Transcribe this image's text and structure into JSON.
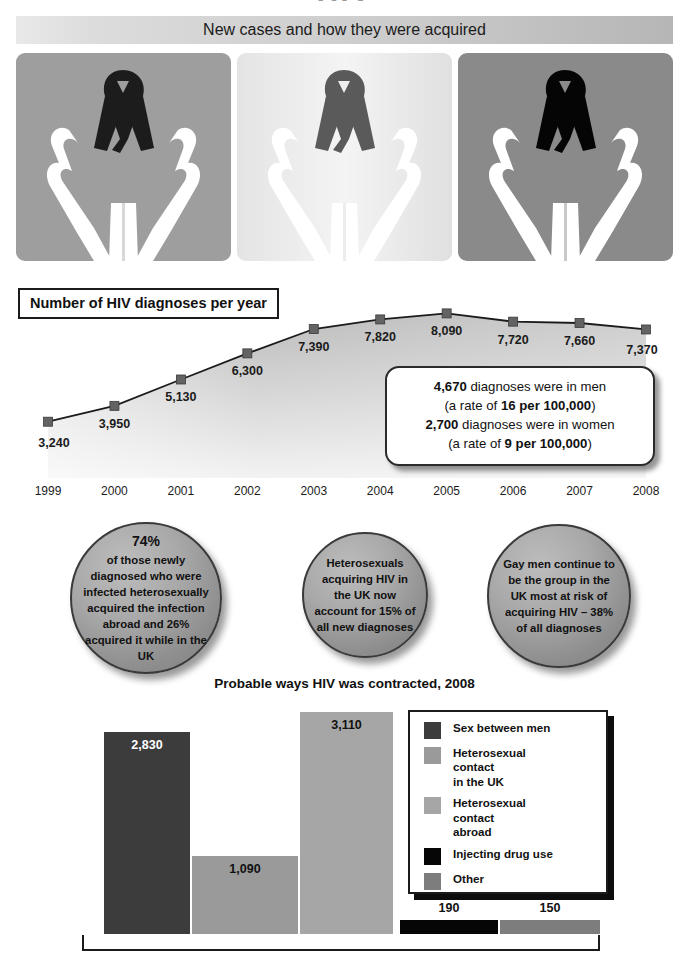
{
  "header": {
    "cut_title": "HIV",
    "subtitle": "New cases and how they were acquired",
    "panels": [
      {
        "name": "hands-ribbon-dark",
        "bg": "#9e9e9e",
        "ribbon": "#1c1c1c"
      },
      {
        "name": "hands-ribbon-mid",
        "bg": "#efefef",
        "ribbon": "#5a5a5a"
      },
      {
        "name": "hands-ribbon-black",
        "bg": "#8a8a8a",
        "ribbon": "#050505"
      }
    ]
  },
  "line_section": {
    "title": "Number of HIV diagnoses per year",
    "callout": {
      "line1_value": "4,670",
      "line1_text": " diagnoses were in men",
      "line2_pre": "(a rate of ",
      "line2_value": "16 per 100,000",
      "line2_post": ")",
      "line3_value": "2,700",
      "line3_text": " diagnoses were in women",
      "line4_pre": "(a rate of ",
      "line4_value": "9 per 100,000",
      "line4_post": ")"
    }
  },
  "bubbles": [
    {
      "name": "bubble-heterosexual-abroad",
      "line1": "74%",
      "body": "of those newly diagnosed who were infected heterosexually acquired the infection abroad and 26% acquired it while in the UK"
    },
    {
      "name": "bubble-heterosexual-uk",
      "line1": "",
      "body": "Heterosexuals acquiring HIV in the UK now account for 15% of all new diagnoses"
    },
    {
      "name": "bubble-gay-men",
      "line1": "",
      "body": "Gay men continue to be the group in the UK most at risk of acquiring HIV – 38% of all diagnoses"
    }
  ],
  "bar_section": {
    "title": "Probable ways HIV was contracted, 2008",
    "legend": [
      {
        "label": "Sex between men",
        "color": "#3c3c3c"
      },
      {
        "label": "Heterosexual\ncontact\nin the UK",
        "color": "#9a9a9a"
      },
      {
        "label": "Heterosexual\ncontact\nabroad",
        "color": "#a6a6a6"
      },
      {
        "label": "Injecting drug use",
        "color": "#060606"
      },
      {
        "label": "Other",
        "color": "#7d7d7d"
      }
    ]
  },
  "chart_data": [
    {
      "type": "line",
      "title": "Number of HIV diagnoses per year",
      "xlabel": "",
      "ylabel": "",
      "categories": [
        "1999",
        "2000",
        "2001",
        "2002",
        "2003",
        "2004",
        "2005",
        "2006",
        "2007",
        "2008"
      ],
      "values": [
        3240,
        3950,
        5130,
        6300,
        7390,
        7820,
        8090,
        7720,
        7660,
        7370
      ],
      "value_labels": [
        "3,240",
        "3,950",
        "5,130",
        "6,300",
        "7,390",
        "7,820",
        "8,090",
        "7,720",
        "7,660",
        "7,370"
      ],
      "ylim": [
        0,
        9000
      ],
      "grid": false,
      "legend_position": "none",
      "annotations": [
        "4,670 diagnoses were in men (a rate of 16 per 100,000)",
        "2,700 diagnoses were in women (a rate of 9 per 100,000)"
      ]
    },
    {
      "type": "bar",
      "title": "Probable ways HIV was contracted, 2008",
      "xlabel": "",
      "ylabel": "",
      "categories": [
        "Sex between men",
        "Heterosexual contact in the UK",
        "Heterosexual contact abroad",
        "Injecting drug use",
        "Other"
      ],
      "values": [
        2830,
        1090,
        3110,
        190,
        150
      ],
      "value_labels": [
        "2,830",
        "1,090",
        "3,110",
        "190",
        "150"
      ],
      "colors": [
        "#3c3c3c",
        "#9a9a9a",
        "#a6a6a6",
        "#060606",
        "#7d7d7d"
      ],
      "ylim": [
        0,
        3400
      ],
      "grid": false,
      "legend_position": "right"
    }
  ]
}
